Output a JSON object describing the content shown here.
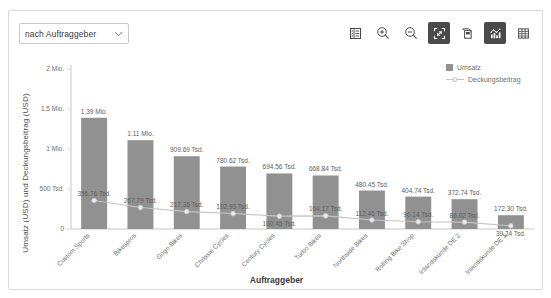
{
  "toolbar": {
    "dropdown": {
      "label": "nach Auftraggeber",
      "chevron_icon": "chevron-down-icon"
    },
    "buttons": [
      {
        "name": "details-list-icon",
        "icon": "list-details-icon",
        "active": false
      },
      {
        "name": "zoom-in-icon",
        "icon": "magnifier-plus-icon",
        "active": false
      },
      {
        "name": "zoom-out-icon",
        "icon": "magnifier-minus-icon",
        "active": false
      },
      {
        "name": "collapse-icon",
        "icon": "shrink-arrows-icon",
        "active": true
      },
      {
        "name": "duplicate-icon",
        "icon": "copy-window-icon",
        "active": false
      },
      {
        "name": "chart-view-icon",
        "icon": "bar-chart-icon",
        "active": true
      },
      {
        "name": "table-view-icon",
        "icon": "grid-table-icon",
        "active": false
      }
    ]
  },
  "legend": {
    "items": [
      {
        "label": "Umsatz",
        "marker": "square",
        "color": "#919191"
      },
      {
        "label": "Deckungsbeitrag",
        "marker": "line-dot",
        "color": "#bdbdbd"
      }
    ]
  },
  "chart_data": {
    "type": "bar",
    "title": "",
    "xlabel": "Auftraggeber",
    "ylabel": "Umsatz (USD) und Deckungsbeitrag (USD)",
    "ylim": [
      0,
      2000000
    ],
    "grid": false,
    "legend_position": "top-right",
    "ytick_values": [
      0,
      500000,
      1000000,
      1500000,
      2000000
    ],
    "ytick_labels": [
      "0",
      "500 Tsd.",
      "1 Mio.",
      "1.5 Mio.",
      "2 Mio."
    ],
    "categories": [
      "Custom Sports",
      "Bikespros",
      "Gogo Bikes",
      "Chrissie Cycles",
      "Century Cycles",
      "Turbo Bikes",
      "Northside Bikes",
      "Rolling Bike Shop",
      "Inlandskunde DE 2",
      "Inlandskunde DE 1"
    ],
    "series": [
      {
        "name": "Umsatz",
        "type": "bar",
        "color": "#919191",
        "values": [
          1390000,
          1110000,
          909690,
          780620,
          694560,
          668840,
          480450,
          404740,
          372740,
          172300
        ],
        "labels": [
          "1.39 Mio.",
          "1.11 Mio.",
          "909.69 Tsd.",
          "780.62 Tsd.",
          "694.56 Tsd.",
          "668.84 Tsd.",
          "480.45 Tsd.",
          "404.74 Tsd.",
          "372.74 Tsd.",
          "172.30 Tsd."
        ]
      },
      {
        "name": "Deckungsbeitrag",
        "type": "line",
        "color": "#c4c4c4",
        "values": [
          356760,
          267790,
          217360,
          192930,
          160450,
          164170,
          112460,
          90140,
          86020,
          39240
        ],
        "labels": [
          "356.76 Tsd.",
          "267.79 Tsd.",
          "217.36 Tsd.",
          "192.93 Tsd.",
          "160.45 Tsd.",
          "164.17 Tsd.",
          "112.46 Tsd.",
          "90.14 Tsd.",
          "86.02 Tsd.",
          "39.24 Tsd."
        ],
        "label_below": [
          false,
          false,
          false,
          false,
          true,
          false,
          false,
          false,
          false,
          true
        ]
      }
    ]
  }
}
